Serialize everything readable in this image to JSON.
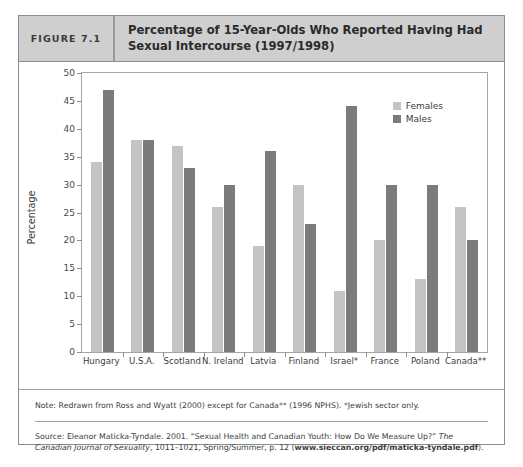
{
  "figure": {
    "number_label": "FIGURE 7.1",
    "title": "Percentage of 15-Year-Olds Who Reported Having Had Sexual Intercourse (1997/1998)"
  },
  "legend": {
    "females_label": "Females",
    "males_label": "Males",
    "females_color": "#c4c4c4",
    "males_color": "#7b7b7b",
    "position": "top-right inside plot"
  },
  "footnotes": {
    "note": "Note: Redrawn from Ross and Wyatt (2000) except for Canada** (1996 NPHS). *Jewish sector only.",
    "source_part1": "Source: Eleanor Maticka-Tyndale. 2001. “Sexual Health and Canadian Youth: How Do We Measure Up?” ",
    "source_italic": "The Canadian Journal of Sexuality",
    "source_part2": ", 1011–1021, Spring/Summer, p. 12 (",
    "source_url": "www.sieccan.org/pdf/maticka-tyndale.pdf",
    "source_part3": ")."
  },
  "chart_data": {
    "type": "bar",
    "title": "Percentage of 15-Year-Olds Who Reported Having Had Sexual Intercourse (1997/1998)",
    "xlabel": "",
    "ylabel": "Percentage",
    "ylim": [
      0,
      50
    ],
    "yticks": [
      0,
      5,
      10,
      15,
      20,
      25,
      30,
      35,
      40,
      45,
      50
    ],
    "grid": false,
    "categories": [
      "Hungary",
      "U.S.A.",
      "Scotland",
      "N. Ireland",
      "Latvia",
      "Finland",
      "Israel*",
      "France",
      "Poland",
      "Canada**"
    ],
    "series": [
      {
        "name": "Females",
        "color": "#c4c4c4",
        "values": [
          34,
          38,
          37,
          26,
          19,
          30,
          11,
          20,
          13,
          26
        ]
      },
      {
        "name": "Males",
        "color": "#7b7b7b",
        "values": [
          47,
          38,
          33,
          30,
          36,
          23,
          44,
          30,
          30,
          20
        ]
      }
    ]
  }
}
